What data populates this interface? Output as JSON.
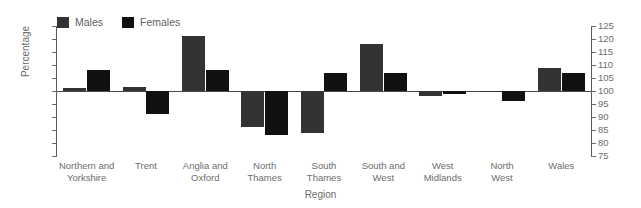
{
  "figure": {
    "clipped_header_text": "",
    "xaxis_title": "Region",
    "yaxis_title": "Percentage"
  },
  "legend": {
    "position": "top-left",
    "entries": [
      {
        "label": "Males",
        "color": "#333333",
        "icon": "legend-swatch-males"
      },
      {
        "label": "Females",
        "color": "#111111",
        "icon": "legend-swatch-females"
      }
    ]
  },
  "axes": {
    "y_ticks": [
      125,
      120,
      115,
      110,
      105,
      100,
      95,
      90,
      85,
      80,
      75
    ],
    "y_min": 75,
    "y_max": 125,
    "baseline": 100,
    "left_tick_labels": [
      "125",
      "120",
      "115",
      "110",
      "105",
      "100",
      "95",
      "90",
      "85",
      "80",
      "75"
    ],
    "right_tick_labels": [
      "125",
      "120",
      "115",
      "110",
      "105",
      "100",
      "95",
      "90",
      "85",
      "80",
      "75"
    ]
  },
  "chart_data": {
    "type": "bar",
    "title": "",
    "subtitle": "",
    "xlabel": "Region",
    "ylabel": "Percentage",
    "ylim": [
      75,
      125
    ],
    "baseline": 100,
    "grid": false,
    "legend_position": "top-left",
    "categories": [
      "Northern and Yorkshire",
      "Trent",
      "Anglia and Oxford",
      "North Thames",
      "South Thames",
      "South and West",
      "West Midlands",
      "North West",
      "Wales"
    ],
    "category_label_lines": [
      [
        "Northern and",
        "Yorkshire"
      ],
      [
        "Trent"
      ],
      [
        "Anglia and",
        "Oxford"
      ],
      [
        "North",
        "Thames"
      ],
      [
        "South",
        "Thames"
      ],
      [
        "South and",
        "West"
      ],
      [
        "West",
        "Midlands"
      ],
      [
        "North",
        "West"
      ],
      [
        "Wales"
      ]
    ],
    "series": [
      {
        "name": "Males",
        "color": "#333333",
        "values": [
          101,
          101.5,
          121,
          86,
          84,
          118,
          98,
          100,
          109
        ]
      },
      {
        "name": "Females",
        "color": "#111111",
        "values": [
          108,
          91,
          108,
          83,
          107,
          107,
          99,
          96,
          107
        ]
      }
    ]
  }
}
